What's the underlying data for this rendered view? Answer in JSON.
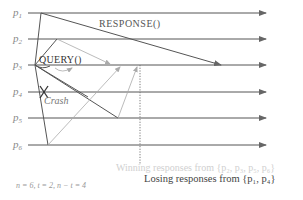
{
  "processes": [
    {
      "id": "p1",
      "label": "p",
      "sub": "1"
    },
    {
      "id": "p2",
      "label": "p",
      "sub": "2"
    },
    {
      "id": "p3",
      "label": "p",
      "sub": "3"
    },
    {
      "id": "p4",
      "label": "p",
      "sub": "4"
    },
    {
      "id": "p5",
      "label": "p",
      "sub": "5"
    },
    {
      "id": "p6",
      "label": "p",
      "sub": "6"
    }
  ],
  "labels": {
    "response": "RESPONSE()",
    "query": "QUERY()",
    "crash": "Crash",
    "winning": "Winning responses from {p₂, p₃, p₅, p₆}",
    "losing": "Losing responses from {p₁, p₄}",
    "params": "n = 6,  t = 2,  n − t = 4"
  },
  "colors": {
    "line": "#555555",
    "gray_message": "#aaaaaa",
    "winning_text": "#d0d0d0",
    "losing_text": "#444444",
    "label": "#8a8a8a"
  }
}
